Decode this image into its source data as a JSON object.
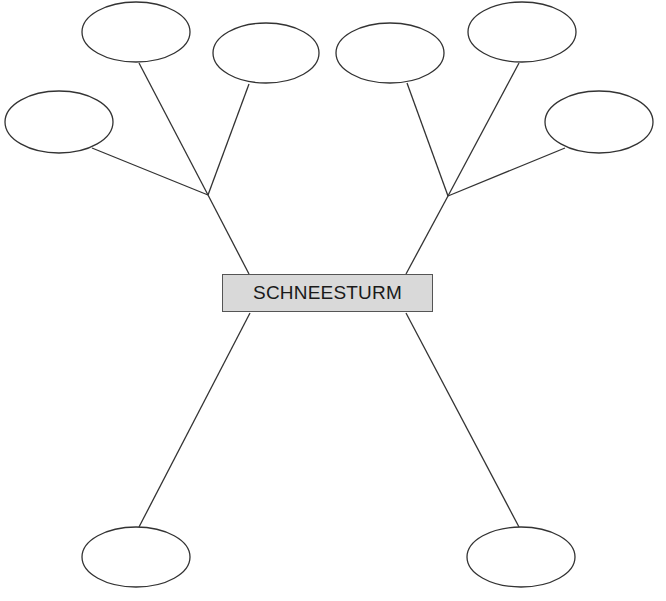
{
  "diagram": {
    "title": "SCHNEESTURM",
    "center_box": {
      "label": "SCHNEESTURM",
      "fill": "#d9d9d9",
      "border": "#555555"
    },
    "ellipses": [
      {
        "id": "top-left-1",
        "label": ""
      },
      {
        "id": "top-left-2",
        "label": ""
      },
      {
        "id": "left",
        "label": ""
      },
      {
        "id": "top-right-1",
        "label": ""
      },
      {
        "id": "top-right-2",
        "label": ""
      },
      {
        "id": "right",
        "label": ""
      },
      {
        "id": "bottom-left",
        "label": ""
      },
      {
        "id": "bottom-right",
        "label": ""
      }
    ]
  }
}
